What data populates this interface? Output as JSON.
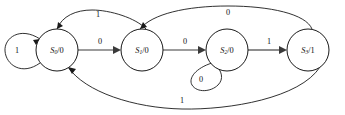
{
  "diagram": {
    "type": "finite-state-machine",
    "title": "",
    "background_color": "#ffffff",
    "line_color": "#1a1a1a",
    "states": [
      {
        "id": "S0",
        "name": "S",
        "subscript": "0",
        "separator": "/",
        "output": "0",
        "label": "S0/0",
        "cx": 57,
        "cy": 50,
        "r": 21
      },
      {
        "id": "S1",
        "name": "S",
        "subscript": "1",
        "separator": "/",
        "output": "0",
        "label": "S1/0",
        "cx": 142,
        "cy": 50,
        "r": 21
      },
      {
        "id": "S2",
        "name": "S",
        "subscript": "2",
        "separator": "/",
        "output": "0",
        "label": "S2/0",
        "cx": 227,
        "cy": 50,
        "r": 21
      },
      {
        "id": "S3",
        "name": "S",
        "subscript": "3",
        "separator": "/",
        "output": "1",
        "label": "S3/1",
        "cx": 308,
        "cy": 50,
        "r": 21
      }
    ],
    "transitions": [
      {
        "id": "t-s0-s0",
        "from": "S0",
        "to": "S0",
        "input": "1",
        "kind": "self-loop-left",
        "label_x": 17,
        "label_y": 51
      },
      {
        "id": "t-s0-s1",
        "from": "S0",
        "to": "S1",
        "input": "0",
        "kind": "straight",
        "label_x": 100,
        "label_y": 42
      },
      {
        "id": "t-s1-s0",
        "from": "S1",
        "to": "S0",
        "input": "1",
        "kind": "arc-top",
        "label_x": 98,
        "label_y": 15
      },
      {
        "id": "t-s1-s2",
        "from": "S1",
        "to": "S2",
        "input": "0",
        "kind": "straight",
        "label_x": 185,
        "label_y": 42
      },
      {
        "id": "t-s2-s2",
        "from": "S2",
        "to": "S2",
        "input": "0",
        "kind": "self-loop-bottom",
        "label_x": 201,
        "label_y": 80
      },
      {
        "id": "t-s2-s3",
        "from": "S2",
        "to": "S3",
        "input": "1",
        "kind": "straight",
        "label_x": 269,
        "label_y": 42
      },
      {
        "id": "t-s3-s1",
        "from": "S3",
        "to": "S1",
        "input": "0",
        "kind": "arc-top-long",
        "label_x": 228,
        "label_y": 13
      },
      {
        "id": "t-s3-s0",
        "from": "S3",
        "to": "S0",
        "input": "1",
        "kind": "arc-bottom-long",
        "label_x": 182,
        "label_y": 101
      }
    ]
  }
}
